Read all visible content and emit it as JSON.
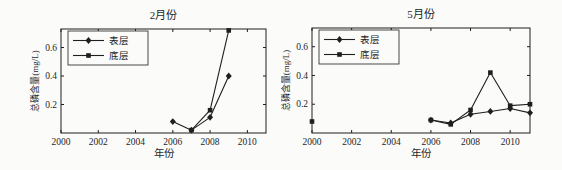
{
  "page": {
    "background": "#fbfbfa",
    "ink": "#1f1f1f",
    "description_visible_text_only": ""
  },
  "chart_data": [
    {
      "type": "line",
      "title": "2月份",
      "xlabel": "年份",
      "ylabel": "总磷含量(mg/L)",
      "xlim": [
        2000,
        2011
      ],
      "ylim": [
        0,
        0.73
      ],
      "xticks": [
        2000,
        2002,
        2004,
        2006,
        2008,
        2010
      ],
      "yticks": [
        0.2,
        0.4,
        0.6
      ],
      "grid": false,
      "legend_position": "top-left",
      "series": [
        {
          "name": "表层",
          "marker": "diamond",
          "color": "#1f1f1f",
          "segments": [
            [
              [
                2006,
                0.08
              ],
              [
                2007,
                0.02
              ],
              [
                2008,
                0.11
              ],
              [
                2009,
                0.4
              ]
            ]
          ]
        },
        {
          "name": "底层",
          "marker": "square",
          "color": "#1f1f1f",
          "segments": [
            [
              [
                2007,
                0.02
              ],
              [
                2008,
                0.16
              ],
              [
                2009,
                0.72
              ]
            ]
          ]
        }
      ]
    },
    {
      "type": "line",
      "title": "5月份",
      "xlabel": "年份",
      "ylabel": "总磷含量(mg/L)",
      "xlim": [
        2000,
        2011
      ],
      "ylim": [
        0,
        0.73
      ],
      "xticks": [
        2000,
        2002,
        2004,
        2006,
        2008,
        2010
      ],
      "yticks": [
        0.2,
        0.4,
        0.6
      ],
      "grid": false,
      "legend_position": "top-left",
      "series": [
        {
          "name": "表层",
          "marker": "diamond",
          "color": "#1f1f1f",
          "segments": [
            [
              [
                2006,
                0.09
              ],
              [
                2007,
                0.07
              ],
              [
                2008,
                0.13
              ],
              [
                2009,
                0.15
              ],
              [
                2010,
                0.17
              ],
              [
                2011,
                0.14
              ]
            ]
          ]
        },
        {
          "name": "底层",
          "marker": "square",
          "color": "#1f1f1f",
          "segments": [
            [
              [
                2000,
                0.08
              ]
            ],
            [
              [
                2006,
                0.09
              ],
              [
                2007,
                0.06
              ],
              [
                2008,
                0.16
              ],
              [
                2009,
                0.42
              ],
              [
                2010,
                0.19
              ],
              [
                2011,
                0.2
              ]
            ]
          ]
        }
      ]
    }
  ]
}
